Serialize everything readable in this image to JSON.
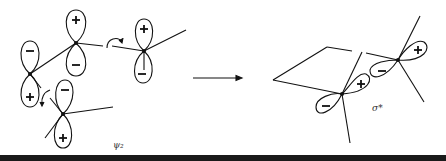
{
  "diagram": {
    "left_label": "ψ₂",
    "right_label": "σ*",
    "signs": {
      "plus": "+",
      "minus": "−"
    },
    "colors": {
      "stroke": "#111111",
      "background": "#ffffff",
      "band": "#1a1a1a"
    },
    "left_structure": {
      "description": "p-orbital lobes of ψ₂ on four carbons with rotation arrows",
      "atoms": [
        {
          "id": "C1",
          "top_sign": "−",
          "bottom_sign": "+"
        },
        {
          "id": "C2",
          "top_sign": "+",
          "bottom_sign": "−"
        },
        {
          "id": "C3",
          "top_sign": "+",
          "bottom_sign": "−"
        },
        {
          "id": "C4",
          "top_sign": "−",
          "bottom_sign": "+"
        }
      ]
    },
    "arrow": "reaction-arrow",
    "right_structure": {
      "description": "σ* orbital from rotated lobes forming new bond",
      "lobes": [
        "−",
        "+",
        "−",
        "+"
      ]
    }
  }
}
